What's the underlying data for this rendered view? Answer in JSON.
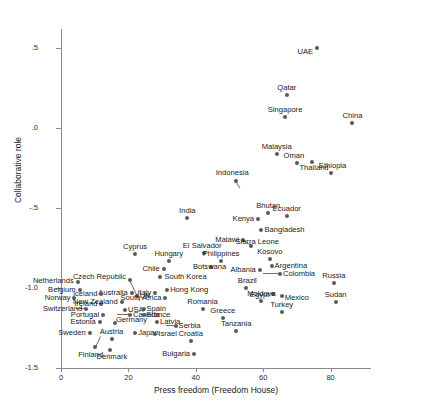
{
  "chart_data": {
    "type": "scatter",
    "title": "",
    "xlabel": "Press freedom (Freedom House)",
    "ylabel": "Collaborative role",
    "xlim": [
      0,
      92
    ],
    "ylim": [
      -1.5,
      0.62
    ],
    "xticks": [
      0,
      20,
      40,
      60,
      80
    ],
    "xtick_labels": [
      "0",
      "20",
      "40",
      "60",
      "80"
    ],
    "yticks": [
      0.5,
      0.0,
      -0.5,
      -1.0,
      -1.5
    ],
    "ytick_labels": [
      ".5",
      ".0",
      "-.5",
      "-1.0",
      "-1.5"
    ],
    "grid": false,
    "legend": null,
    "point_color": "#5a5a5a",
    "axis_color": "#8a8a8a",
    "points": [
      {
        "label": "UAE",
        "x": 76.0,
        "y": 0.5,
        "pos": "r",
        "lx": -4,
        "ly": 4
      },
      {
        "label": "Qatar",
        "x": 67.0,
        "y": 0.21,
        "pos": "t",
        "lx": 0,
        "ly": -3
      },
      {
        "label": "China",
        "x": 86.5,
        "y": 0.03,
        "pos": "t",
        "lx": 0,
        "ly": -3
      },
      {
        "label": "Singapore",
        "x": 66.5,
        "y": 0.07,
        "pos": "t",
        "lx": 0,
        "ly": -3
      },
      {
        "label": "Malaysia",
        "x": 64.0,
        "y": -0.16,
        "pos": "t",
        "lx": 0,
        "ly": -3
      },
      {
        "label": "Oman",
        "x": 70.0,
        "y": -0.22,
        "pos": "t",
        "lx": -3,
        "ly": -3
      },
      {
        "label": "Thailand",
        "x": 74.5,
        "y": -0.21,
        "pos": "b",
        "lx": 2,
        "ly": 2
      },
      {
        "label": "Ethiopia",
        "x": 80.0,
        "y": -0.28,
        "pos": "t",
        "lx": 2,
        "ly": -3
      },
      {
        "label": "Indonesia",
        "x": 52.0,
        "y": -0.33,
        "pos": "t",
        "lx": -4,
        "ly": -4
      },
      {
        "label": "India",
        "x": 37.5,
        "y": -0.56,
        "pos": "t",
        "lx": 0,
        "ly": -3
      },
      {
        "label": "Kenya",
        "x": 58.5,
        "y": -0.57,
        "pos": "r",
        "lx": -4,
        "ly": 0
      },
      {
        "label": "Bhutan",
        "x": 61.5,
        "y": -0.53,
        "pos": "t",
        "lx": 0,
        "ly": -3
      },
      {
        "label": "Ecuador",
        "x": 67.0,
        "y": -0.55,
        "pos": "t",
        "lx": 0,
        "ly": -3
      },
      {
        "label": "Bangladesh",
        "x": 59.5,
        "y": -0.64,
        "pos": "l",
        "lx": 3,
        "ly": 0
      },
      {
        "label": "Malawi",
        "x": 54.0,
        "y": -0.7,
        "pos": "r",
        "lx": -4,
        "ly": 0
      },
      {
        "label": "Sierra Leone",
        "x": 56.5,
        "y": -0.74,
        "pos": "l",
        "lx": -16,
        "ly": -4
      },
      {
        "label": "Cyprus",
        "x": 22.0,
        "y": -0.79,
        "pos": "t",
        "lx": 0,
        "ly": -3
      },
      {
        "label": "El Salvador",
        "x": 42.5,
        "y": -0.78,
        "pos": "t",
        "lx": -2,
        "ly": -3
      },
      {
        "label": "Philippines",
        "x": 47.5,
        "y": -0.83,
        "pos": "t",
        "lx": 0,
        "ly": -3
      },
      {
        "label": "Hungary",
        "x": 32.0,
        "y": -0.83,
        "pos": "t",
        "lx": 0,
        "ly": -3
      },
      {
        "label": "Kosovo",
        "x": 62.0,
        "y": -0.82,
        "pos": "t",
        "lx": 0,
        "ly": -3
      },
      {
        "label": "Argentina",
        "x": 62.5,
        "y": -0.86,
        "pos": "l",
        "lx": 3,
        "ly": 0
      },
      {
        "label": "Chile",
        "x": 30.5,
        "y": -0.88,
        "pos": "r",
        "lx": -4,
        "ly": 0
      },
      {
        "label": "Botswana",
        "x": 44.5,
        "y": -0.87,
        "pos": "l",
        "lx": -18,
        "ly": 0
      },
      {
        "label": "Albania",
        "x": 59.0,
        "y": -0.89,
        "pos": "r",
        "lx": -4,
        "ly": 0
      },
      {
        "label": "Colombia",
        "x": 65.0,
        "y": -0.91,
        "pos": "l",
        "lx": 3,
        "ly": 0
      },
      {
        "label": "South Korea",
        "x": 29.5,
        "y": -0.93,
        "pos": "l",
        "lx": 4,
        "ly": 0
      },
      {
        "label": "Netherlands",
        "x": 5.0,
        "y": -0.96,
        "pos": "r",
        "lx": -4,
        "ly": -1
      },
      {
        "label": "Czech Republic",
        "x": 20.5,
        "y": -0.95,
        "pos": "r",
        "lx": -4,
        "ly": -3
      },
      {
        "label": "Russia",
        "x": 81.0,
        "y": -0.97,
        "pos": "t",
        "lx": 0,
        "ly": -3
      },
      {
        "label": "Belgium",
        "x": 5.5,
        "y": -1.01,
        "pos": "r",
        "lx": -4,
        "ly": 0
      },
      {
        "label": "Hong Kong",
        "x": 31.5,
        "y": -1.01,
        "pos": "l",
        "lx": 3,
        "ly": 0
      },
      {
        "label": "Brazil",
        "x": 55.0,
        "y": -1.0,
        "pos": "t",
        "lx": 1,
        "ly": -3
      },
      {
        "label": "Italy",
        "x": 28.0,
        "y": -1.03,
        "pos": "r",
        "lx": -4,
        "ly": 0
      },
      {
        "label": "Australia",
        "x": 21.0,
        "y": -1.03,
        "pos": "r",
        "lx": -4,
        "ly": 0
      },
      {
        "label": "Iceland",
        "x": 12.0,
        "y": -1.04,
        "pos": "r",
        "lx": -4,
        "ly": 0
      },
      {
        "label": "Norway",
        "x": 4.0,
        "y": -1.06,
        "pos": "r",
        "lx": -4,
        "ly": 0
      },
      {
        "label": "UK",
        "x": 22.5,
        "y": -1.05,
        "pos": "l",
        "lx": 3,
        "ly": 0
      },
      {
        "label": "South Africa",
        "x": 31.0,
        "y": -1.06,
        "pos": "r",
        "lx": -4,
        "ly": 0
      },
      {
        "label": "Egypt",
        "x": 63.0,
        "y": -1.04,
        "pos": "r",
        "lx": -4,
        "ly": 1
      },
      {
        "label": "Moldova",
        "x": 59.5,
        "y": -1.08,
        "pos": "t",
        "lx": 0,
        "ly": -3
      },
      {
        "label": "Sudan",
        "x": 81.5,
        "y": -1.09,
        "pos": "t",
        "lx": 0,
        "ly": -3
      },
      {
        "label": "Mexico",
        "x": 65.5,
        "y": -1.05,
        "pos": "l",
        "lx": 3,
        "ly": 2
      },
      {
        "label": "Ireland",
        "x": 12.0,
        "y": -1.1,
        "pos": "r",
        "lx": -4,
        "ly": 0
      },
      {
        "label": "New Zealand",
        "x": 18.0,
        "y": -1.09,
        "pos": "r",
        "lx": -4,
        "ly": 0
      },
      {
        "label": "Spain",
        "x": 24.5,
        "y": -1.13,
        "pos": "l",
        "lx": 3,
        "ly": 0
      },
      {
        "label": "USA",
        "x": 19.0,
        "y": -1.14,
        "pos": "l",
        "lx": 3,
        "ly": 0
      },
      {
        "label": "Switzerland",
        "x": 7.5,
        "y": -1.13,
        "pos": "r",
        "lx": -4,
        "ly": 0
      },
      {
        "label": "Turkey",
        "x": 65.5,
        "y": -1.15,
        "pos": "t",
        "lx": 0,
        "ly": -3
      },
      {
        "label": "Romania",
        "x": 42.0,
        "y": -1.13,
        "pos": "t",
        "lx": 0,
        "ly": -3
      },
      {
        "label": "Portugal",
        "x": 12.5,
        "y": -1.17,
        "pos": "r",
        "lx": -4,
        "ly": 0
      },
      {
        "label": "Canada",
        "x": 20.5,
        "y": -1.17,
        "pos": "l",
        "lx": 3,
        "ly": 0
      },
      {
        "label": "France",
        "x": 24.5,
        "y": -1.17,
        "pos": "l",
        "lx": 3,
        "ly": 0
      },
      {
        "label": "Greece",
        "x": 48.0,
        "y": -1.19,
        "pos": "t",
        "lx": 0,
        "ly": -3
      },
      {
        "label": "Estonia",
        "x": 11.5,
        "y": -1.21,
        "pos": "r",
        "lx": -4,
        "ly": 0
      },
      {
        "label": "Germany",
        "x": 16.0,
        "y": -1.22,
        "pos": "l",
        "lx": 1,
        "ly": -3
      },
      {
        "label": "Latvia",
        "x": 28.5,
        "y": -1.21,
        "pos": "l",
        "lx": 3,
        "ly": 0
      },
      {
        "label": "Serbia",
        "x": 34.0,
        "y": -1.24,
        "pos": "l",
        "lx": 3,
        "ly": 0
      },
      {
        "label": "Tanzania",
        "x": 52.0,
        "y": -1.27,
        "pos": "t",
        "lx": 0,
        "ly": -3
      },
      {
        "label": "Sweden",
        "x": 8.5,
        "y": -1.28,
        "pos": "r",
        "lx": -4,
        "ly": 0
      },
      {
        "label": "Japan",
        "x": 22.0,
        "y": -1.28,
        "pos": "l",
        "lx": 3,
        "ly": 0
      },
      {
        "label": "Israel",
        "x": 28.0,
        "y": -1.29,
        "pos": "l",
        "lx": 3,
        "ly": 0
      },
      {
        "label": "Austria",
        "x": 15.0,
        "y": -1.32,
        "pos": "t",
        "lx": 0,
        "ly": -3
      },
      {
        "label": "Croatia",
        "x": 38.5,
        "y": -1.33,
        "pos": "t",
        "lx": 0,
        "ly": -3
      },
      {
        "label": "Finland",
        "x": 10.0,
        "y": -1.37,
        "pos": "b",
        "lx": -4,
        "ly": 4
      },
      {
        "label": "Denmark",
        "x": 14.5,
        "y": -1.39,
        "pos": "b",
        "lx": 2,
        "ly": 3
      },
      {
        "label": "Bulgaria",
        "x": 39.5,
        "y": -1.41,
        "pos": "r",
        "lx": -4,
        "ly": 0
      }
    ],
    "leaders": [
      {
        "from_label": "Czech Republic",
        "x1": 20.5,
        "y1": -0.95,
        "x2": 23.5,
        "y2": -1.08
      },
      {
        "from_label": "Indonesia",
        "x1": 52.0,
        "y1": -0.33,
        "x2": 53.2,
        "y2": -0.37
      },
      {
        "from_label": "Switzerland",
        "x1": 7.5,
        "y1": -1.13,
        "x2": 4.5,
        "y2": -1.13
      },
      {
        "from_label": "Canada",
        "x1": 20.5,
        "y1": -1.17,
        "x2": 16.5,
        "y2": -1.17
      },
      {
        "from_label": "Sierra Leone",
        "x1": 56.5,
        "y1": -0.74,
        "x2": 54.2,
        "y2": -0.71
      },
      {
        "from_label": "Colombia",
        "x1": 65.0,
        "y1": -0.91,
        "x2": 60.0,
        "y2": -0.91
      },
      {
        "from_label": "Serbia",
        "x1": 34.0,
        "y1": -1.24,
        "x2": 31.0,
        "y2": -1.24
      },
      {
        "from_label": "Finland",
        "x1": 10.0,
        "y1": -1.37,
        "x2": 11.6,
        "y2": -1.3
      }
    ]
  }
}
